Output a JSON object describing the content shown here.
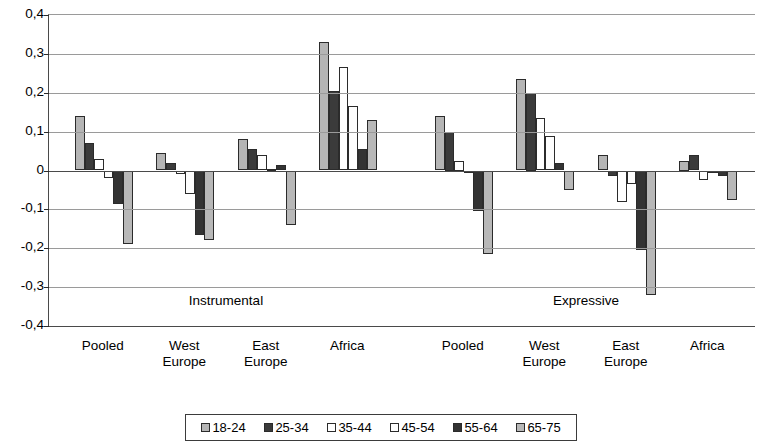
{
  "chart_data": {
    "type": "bar",
    "title": "",
    "subtitle": "",
    "xlabel": "",
    "ylabel": "",
    "ylim": [
      -0.4,
      0.4
    ],
    "ytick_step": 0.1,
    "ytick_labels": [
      "0,4",
      "0,3",
      "0,2",
      "0,1",
      "0",
      "-0,1",
      "-0,2",
      "-0,3",
      "-0,4"
    ],
    "ytick_values": [
      0.4,
      0.3,
      0.2,
      0.1,
      0,
      -0.1,
      -0.2,
      -0.3,
      -0.4
    ],
    "grid": true,
    "legend_position": "bottom",
    "panels": [
      "Instrumental",
      "Expressive"
    ],
    "categories": [
      "Pooled",
      "West Europe",
      "East Europe",
      "Africa"
    ],
    "category_lines": [
      [
        "Pooled"
      ],
      [
        "West",
        "Europe"
      ],
      [
        "East",
        "Europe"
      ],
      [
        "Africa"
      ]
    ],
    "series_names": [
      "18-24",
      "25-34",
      "35-44",
      "45-54",
      "55-64",
      "65-75"
    ],
    "series_colors": [
      "#b5b5b5",
      "#3b3b3b",
      "#ffffff",
      "#fdfdfd",
      "#333333",
      "#b8b8b8"
    ],
    "groups": [
      {
        "panel": "Instrumental",
        "category": "Pooled",
        "values": [
          0.14,
          0.07,
          0.03,
          -0.02,
          -0.085,
          -0.19
        ]
      },
      {
        "panel": "Instrumental",
        "category": "West Europe",
        "values": [
          0.045,
          0.02,
          -0.01,
          -0.06,
          -0.165,
          -0.18
        ]
      },
      {
        "panel": "Instrumental",
        "category": "East Europe",
        "values": [
          0.08,
          0.055,
          0.04,
          0.005,
          0.015,
          -0.14
        ]
      },
      {
        "panel": "Instrumental",
        "category": "Africa",
        "values": [
          0.33,
          0.205,
          0.265,
          0.165,
          0.055,
          0.13
        ]
      },
      {
        "panel": "Expressive",
        "category": "Pooled",
        "values": [
          0.14,
          0.1,
          0.025,
          0.0,
          -0.105,
          -0.215
        ]
      },
      {
        "panel": "Expressive",
        "category": "West Europe",
        "values": [
          0.235,
          0.2,
          0.135,
          0.09,
          0.02,
          -0.05
        ]
      },
      {
        "panel": "Expressive",
        "category": "East Europe",
        "values": [
          0.04,
          -0.015,
          -0.08,
          -0.035,
          -0.205,
          -0.32
        ]
      },
      {
        "panel": "Expressive",
        "category": "Africa",
        "values": [
          0.025,
          0.04,
          -0.025,
          -0.005,
          -0.015,
          -0.075
        ]
      }
    ]
  },
  "legend": {
    "entries": [
      {
        "label": "18-24",
        "color": "#b5b5b5"
      },
      {
        "label": "25-34",
        "color": "#3b3b3b"
      },
      {
        "label": "35-44",
        "color": "#ffffff"
      },
      {
        "label": "45-54",
        "color": "#fdfdfd"
      },
      {
        "label": "55-64",
        "color": "#333333"
      },
      {
        "label": "65-75",
        "color": "#b8b8b8"
      }
    ]
  }
}
